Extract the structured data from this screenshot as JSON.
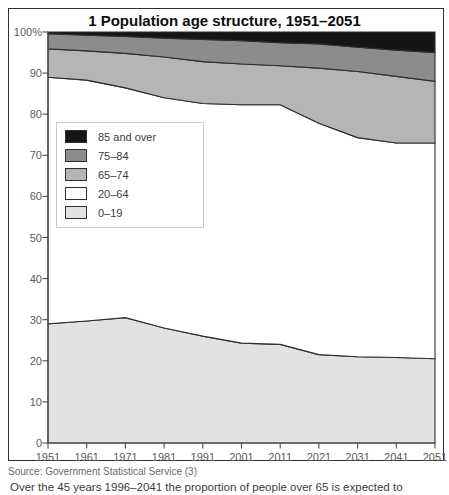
{
  "figure": {
    "title": "1 Population age structure, 1951–2051",
    "source": "Source: Government Statistical Service (3)",
    "caption": "Over the 45 years 1996–2041 the proportion of people over 65 is expected to increase by a half"
  },
  "chart_data": {
    "type": "area",
    "stacked": true,
    "title": "1 Population age structure, 1951–2051",
    "xlabel": "",
    "ylabel": "",
    "ylim": [
      0,
      100
    ],
    "grid": false,
    "legend_position": "inside-left",
    "x": [
      1951,
      1961,
      1971,
      1981,
      1991,
      2001,
      2011,
      2021,
      2031,
      2041,
      2051
    ],
    "x_tick_labels": [
      "1951",
      "1961",
      "1971",
      "1981",
      "1991",
      "2001",
      "2011",
      "2021",
      "2031",
      "2041",
      "2051"
    ],
    "y_ticks": [
      {
        "value": 100,
        "label": "100%"
      },
      {
        "value": 90,
        "label": "90"
      },
      {
        "value": 80,
        "label": "80"
      },
      {
        "value": 70,
        "label": "70"
      },
      {
        "value": 60,
        "label": "60"
      },
      {
        "value": 50,
        "label": "50"
      },
      {
        "value": 40,
        "label": "40"
      },
      {
        "value": 30,
        "label": "30"
      },
      {
        "value": 20,
        "label": "20"
      },
      {
        "value": 10,
        "label": "10"
      },
      {
        "value": 0,
        "label": "0"
      }
    ],
    "series": [
      {
        "name": "0–19",
        "color": "#e2e2e2",
        "values": [
          29,
          29.7,
          30.5,
          28,
          26,
          24.3,
          24,
          21.5,
          21,
          20.8,
          20.5
        ]
      },
      {
        "name": "20–64",
        "color": "#ffffff",
        "values": [
          60,
          58.6,
          55.9,
          56,
          56.6,
          58,
          58.3,
          56.3,
          53.3,
          52.2,
          52.5
        ]
      },
      {
        "name": "65–74",
        "color": "#b5b5b5",
        "values": [
          6.9,
          7.1,
          8.4,
          9.9,
          10.2,
          9.9,
          9.5,
          13.4,
          16.1,
          16.2,
          15
        ]
      },
      {
        "name": "75–84",
        "color": "#8c8c8c",
        "values": [
          3.7,
          3.8,
          4.1,
          4.6,
          5.4,
          5.7,
          5.6,
          5.9,
          5.9,
          6.4,
          7
        ]
      },
      {
        "name": "85 and over",
        "color": "#151515",
        "values": [
          0.4,
          0.8,
          1.1,
          1.5,
          1.8,
          2.1,
          2.6,
          2.9,
          3.7,
          4.4,
          5
        ]
      }
    ],
    "legend": [
      {
        "label": "85 and over",
        "color": "#151515"
      },
      {
        "label": "75–84",
        "color": "#8c8c8c"
      },
      {
        "label": "65–74",
        "color": "#b5b5b5"
      },
      {
        "label": "20–64",
        "color": "#ffffff"
      },
      {
        "label": "0–19",
        "color": "#e2e2e2"
      }
    ],
    "axis_color": "#4a4a4a",
    "band_outline_color": "#2e2e2e"
  }
}
